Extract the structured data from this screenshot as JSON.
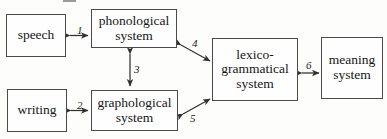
{
  "diagram": {
    "background_color": "#fdfdfc",
    "line_color": "#4a4a4a",
    "text_color": "#161616",
    "nodes": [
      {
        "id": "speech",
        "label": "speech"
      },
      {
        "id": "writing",
        "label": "writing"
      },
      {
        "id": "phonological",
        "label": "phonological system"
      },
      {
        "id": "graphological",
        "label": "graphological system"
      },
      {
        "id": "lexicogrammatical",
        "label": "lexico-grammatical system"
      },
      {
        "id": "meaning",
        "label": "meaning system"
      }
    ],
    "connections": [
      {
        "number": "1",
        "from": "speech",
        "to": "phonological",
        "style": "double-arrow",
        "orientation": "horizontal"
      },
      {
        "number": "2",
        "from": "writing",
        "to": "graphological",
        "style": "double-arrow",
        "orientation": "horizontal"
      },
      {
        "number": "3",
        "from": "phonological",
        "to": "graphological",
        "style": "double-arrow",
        "orientation": "vertical"
      },
      {
        "number": "4",
        "from": "phonological",
        "to": "lexicogrammatical",
        "style": "double-arrow",
        "orientation": "diagonal-down-right"
      },
      {
        "number": "5",
        "from": "graphological",
        "to": "lexicogrammatical",
        "style": "double-arrow",
        "orientation": "diagonal-up-right"
      },
      {
        "number": "6",
        "from": "lexicogrammatical",
        "to": "meaning",
        "style": "double-arrow",
        "orientation": "horizontal"
      }
    ]
  }
}
